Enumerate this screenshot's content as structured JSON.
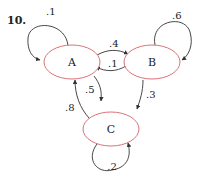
{
  "problem_number": "10.",
  "colors": {
    "node_stroke": "#d9737a",
    "edge": "#333333",
    "text": "#222222"
  },
  "nodes": [
    {
      "id": "A",
      "label": "A"
    },
    {
      "id": "B",
      "label": "B"
    },
    {
      "id": "C",
      "label": "C"
    }
  ],
  "edges": [
    {
      "from": "A",
      "to": "A",
      "label": ".1"
    },
    {
      "from": "B",
      "to": "B",
      "label": ".6"
    },
    {
      "from": "C",
      "to": "C",
      "label": ".2"
    },
    {
      "from": "A",
      "to": "B",
      "label": ".4"
    },
    {
      "from": "B",
      "to": "A",
      "label": ".1"
    },
    {
      "from": "A",
      "to": "C",
      "label": ".5"
    },
    {
      "from": "C",
      "to": "A",
      "label": ".8"
    },
    {
      "from": "B",
      "to": "C",
      "label": ".3"
    }
  ]
}
